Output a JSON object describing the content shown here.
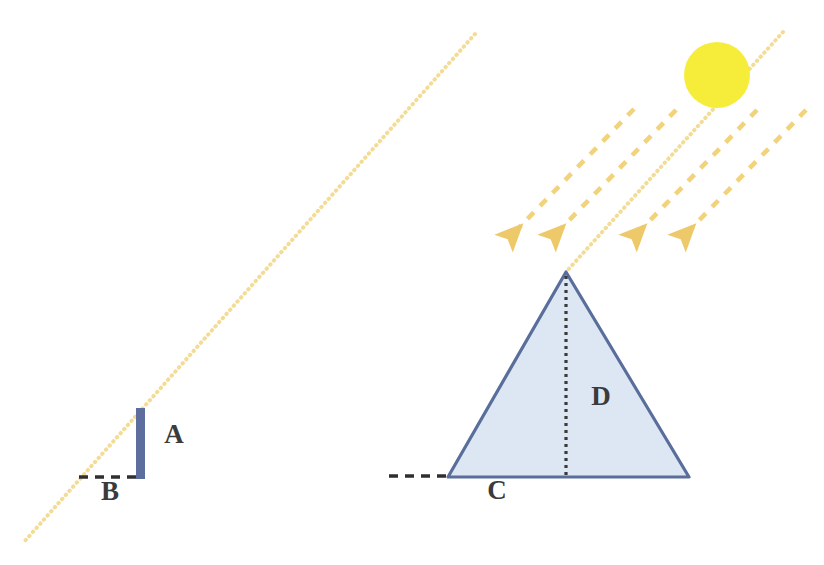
{
  "figure": {
    "background_color": "#ffffff",
    "width": 824,
    "height": 565
  },
  "colors": {
    "sun": "#f6ec3a",
    "ray": "#f2d27a",
    "ray_light": "#f6e3a8",
    "triangle_fill": "#dce7f3",
    "triangle_stroke": "#5a6e9c",
    "pole": "#5d6d9e",
    "dashed_ground": "#3a3a3a",
    "label_text": "#3b3b3b"
  },
  "labels": {
    "pole_height": "A",
    "pole_shadow": "B",
    "pyramid_shadow": "C",
    "pyramid_height": "D"
  },
  "shapes": {
    "sun": {
      "name": "sun",
      "cx": 717,
      "cy": 75,
      "r": 33
    },
    "pole": {
      "name": "vertical-pole",
      "x": 140,
      "y_top": 408,
      "y_bottom": 479,
      "width": 9
    },
    "pole_shadow_line": {
      "name": "pole-shadow",
      "x1": 79,
      "x2": 140,
      "y": 477
    },
    "pyramid": {
      "name": "pyramid-triangle",
      "apex_x": 566,
      "apex_y": 272,
      "base_left_x": 448,
      "base_right_x": 689,
      "base_y": 477
    },
    "pyramid_height_line": {
      "name": "pyramid-height-dotted",
      "x": 566,
      "y_top": 275,
      "y_bottom": 477
    },
    "pyramid_shadow_line": {
      "name": "pyramid-shadow",
      "x1": 389,
      "x2": 448,
      "y": 476
    }
  },
  "sun_rays": {
    "dotted_pole_ray": {
      "name": "dotted-ray-to-pole",
      "x1": 475,
      "y1": 34,
      "x2": 24,
      "y2": 542
    },
    "dotted_pyramid_ray": {
      "name": "dotted-ray-to-pyramid-apex",
      "x1": 783,
      "y1": 32,
      "x2": 566,
      "y2": 272
    },
    "arrows": [
      {
        "name": "sun-ray-arrow-1",
        "x1": 634,
        "y1": 109,
        "x2": 504,
        "y2": 243
      },
      {
        "name": "sun-ray-arrow-2",
        "x1": 676,
        "y1": 110,
        "x2": 547,
        "y2": 243
      },
      {
        "name": "sun-ray-arrow-3",
        "x1": 757,
        "y1": 110,
        "x2": 628,
        "y2": 243
      },
      {
        "name": "sun-ray-arrow-4",
        "x1": 806,
        "y1": 110,
        "x2": 677,
        "y2": 243
      }
    ]
  },
  "label_positions": {
    "A": {
      "x": 174,
      "y": 443
    },
    "B": {
      "x": 110,
      "y": 497
    },
    "C": {
      "x": 496,
      "y": 496
    },
    "D": {
      "x": 600,
      "y": 400
    }
  }
}
